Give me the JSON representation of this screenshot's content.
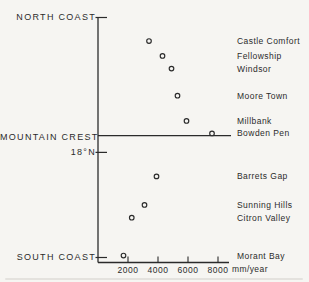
{
  "chart_data": {
    "type": "scatter",
    "title": "",
    "xlabel": "mm/year",
    "x_tick_labels": [
      "2000",
      "4000",
      "6000",
      "8000"
    ],
    "x_tick_values": [
      2000,
      4000,
      6000,
      8000
    ],
    "x_range_mm": [
      0,
      8750
    ],
    "marker": "open-circle",
    "ink_color": "#2b2b2b",
    "background_color": "#f6f5f2",
    "annotations": [
      {
        "id": "north-coast",
        "label": "NORTH COAST",
        "y_frac": 0.0,
        "kind": "tick"
      },
      {
        "id": "mountain-crest",
        "label": "MOUNTAIN CREST",
        "y_frac": 0.492,
        "kind": "line"
      },
      {
        "id": "latitude-18n",
        "label": "18°N",
        "y_frac": 0.562,
        "kind": "tick"
      },
      {
        "id": "south-coast",
        "label": "SOUTH COAST",
        "y_frac": 1.0,
        "kind": "tick"
      }
    ],
    "stations": [
      {
        "name": "Castle Comfort",
        "rainfall_mm_per_year": 3400,
        "y_frac": 0.098
      },
      {
        "name": "Fellowship",
        "rainfall_mm_per_year": 4300,
        "y_frac": 0.16
      },
      {
        "name": "Windsor",
        "rainfall_mm_per_year": 4900,
        "y_frac": 0.213
      },
      {
        "name": "Moore Town",
        "rainfall_mm_per_year": 5300,
        "y_frac": 0.326
      },
      {
        "name": "Millbank",
        "rainfall_mm_per_year": 5900,
        "y_frac": 0.431
      },
      {
        "name": "Bowden Pen",
        "rainfall_mm_per_year": 7600,
        "y_frac": 0.483
      },
      {
        "name": "Barrets Gap",
        "rainfall_mm_per_year": 3900,
        "y_frac": 0.662
      },
      {
        "name": "Sunning Hills",
        "rainfall_mm_per_year": 3100,
        "y_frac": 0.781
      },
      {
        "name": "Citron Valley",
        "rainfall_mm_per_year": 2250,
        "y_frac": 0.834
      },
      {
        "name": "Morant Bay",
        "rainfall_mm_per_year": 1700,
        "y_frac": 0.992
      }
    ]
  }
}
